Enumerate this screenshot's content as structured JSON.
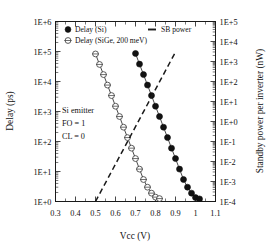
{
  "chart_data": {
    "type": "line",
    "title": "",
    "xlabel": "Vcc (V)",
    "ylabel": "Delay (ps)",
    "ylabel_right": "Standby power per inverter (nW)",
    "xlim": [
      0.3,
      1.1
    ],
    "ylim": [
      1.0,
      1000000.0
    ],
    "ylim_right": [
      0.0001,
      100000.0
    ],
    "xscale": "linear",
    "yscale": "log",
    "grid": false,
    "legend_position": "top-inside",
    "xticks": [
      0.3,
      0.4,
      0.5,
      0.6,
      0.7,
      0.8,
      0.9,
      1.0,
      1.1
    ],
    "xtick_labels": [
      "0.3",
      "0.4",
      "0.5",
      "0.6",
      "0.7",
      "0.8",
      "0.9",
      "1",
      "1.1"
    ],
    "ytick_labels": [
      "1E+0",
      "1E+1",
      "1E+2",
      "1E+3",
      "1E+4",
      "1E+5",
      "1E+6"
    ],
    "ytick_labels_right": [
      "1E-4",
      "1E-3",
      "1E-2",
      "1E-1",
      "1E+0",
      "1E+1",
      "1E+2",
      "1E+3",
      "1E+4",
      "1E+5"
    ],
    "annotations": [
      "Si emitter",
      "FO = 1",
      "CL = 0"
    ],
    "series": [
      {
        "name": "Delay (Si)",
        "marker": "filled-circle",
        "linestyle": "solid",
        "axis": "left",
        "x": [
          0.7,
          0.72,
          0.74,
          0.76,
          0.78,
          0.8,
          0.82,
          0.84,
          0.86,
          0.88,
          0.9,
          0.92,
          0.94,
          0.96,
          0.98,
          1.0,
          1.02
        ],
        "y": [
          86000,
          38000,
          17000,
          7600,
          3400,
          1500,
          680,
          300,
          135,
          60,
          27,
          12,
          5.4,
          3.0,
          1.9,
          1.35,
          1.22
        ]
      },
      {
        "name": "Delay (SiGe, 200 meV)",
        "marker": "open-circle",
        "linestyle": "solid",
        "axis": "left",
        "x": [
          0.5,
          0.52,
          0.54,
          0.56,
          0.58,
          0.6,
          0.62,
          0.64,
          0.66,
          0.68,
          0.7,
          0.72,
          0.74,
          0.76,
          0.78,
          0.8,
          0.82
        ],
        "y": [
          83000,
          37000,
          17000,
          7600,
          3400,
          1500,
          680,
          300,
          135,
          60,
          27,
          12,
          5.4,
          3.0,
          1.9,
          1.4,
          1.25
        ]
      },
      {
        "name": "SB power",
        "marker": "none",
        "linestyle": "dashed",
        "axis": "right",
        "x": [
          0.5,
          0.9
        ],
        "y": [
          0.0001,
          3000
        ]
      }
    ]
  },
  "legend": {
    "items": [
      {
        "label": "Delay (Si)",
        "marker": "filled-circle"
      },
      {
        "label": "Delay (SiGe, 200 meV)",
        "marker": "open-circle"
      },
      {
        "label": "SB power",
        "marker": "dash"
      }
    ]
  },
  "colors": {
    "axis": "#1a1a1a",
    "series_si": "#111111",
    "series_sige": "#333333",
    "series_sb": "#1a1a1a",
    "background": "#ffffff"
  }
}
